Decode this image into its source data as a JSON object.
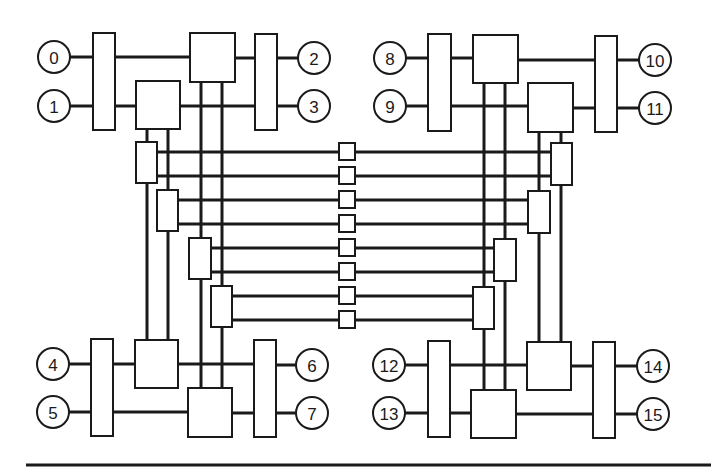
{
  "diagram": {
    "title": "",
    "colors": {
      "stroke": "#1a1a1a",
      "fill": "#ffffff",
      "background": "#ffffff"
    },
    "nodes": [
      {
        "id": "n0",
        "label": "0",
        "x": 54,
        "y": 57
      },
      {
        "id": "n1",
        "label": "1",
        "x": 54,
        "y": 106
      },
      {
        "id": "n2",
        "label": "2",
        "x": 314,
        "y": 58
      },
      {
        "id": "n3",
        "label": "3",
        "x": 314,
        "y": 106
      },
      {
        "id": "n4",
        "label": "4",
        "x": 53,
        "y": 364
      },
      {
        "id": "n5",
        "label": "5",
        "x": 53,
        "y": 412
      },
      {
        "id": "n6",
        "label": "6",
        "x": 312,
        "y": 365
      },
      {
        "id": "n7",
        "label": "7",
        "x": 312,
        "y": 413
      },
      {
        "id": "n8",
        "label": "8",
        "x": 390,
        "y": 58
      },
      {
        "id": "n9",
        "label": "9",
        "x": 390,
        "y": 106
      },
      {
        "id": "n10",
        "label": "10",
        "x": 655,
        "y": 60
      },
      {
        "id": "n11",
        "label": "11",
        "x": 655,
        "y": 108
      },
      {
        "id": "n12",
        "label": "12",
        "x": 389,
        "y": 365
      },
      {
        "id": "n13",
        "label": "13",
        "x": 389,
        "y": 413
      },
      {
        "id": "n14",
        "label": "14",
        "x": 653,
        "y": 366
      },
      {
        "id": "n15",
        "label": "15",
        "x": 653,
        "y": 414
      }
    ],
    "node_radius": 16,
    "boxes": [
      {
        "id": "tl-bar-left",
        "x": 93,
        "y": 33,
        "w": 22,
        "h": 97
      },
      {
        "id": "tl-switch-a",
        "x": 190,
        "y": 33,
        "w": 45,
        "h": 49
      },
      {
        "id": "tl-switch-b",
        "x": 136,
        "y": 81,
        "w": 44,
        "h": 48
      },
      {
        "id": "tl-bar-right",
        "x": 255,
        "y": 34,
        "w": 22,
        "h": 96
      },
      {
        "id": "tr-bar-left",
        "x": 428,
        "y": 34,
        "w": 23,
        "h": 97
      },
      {
        "id": "tr-switch-c",
        "x": 473,
        "y": 35,
        "w": 45,
        "h": 48
      },
      {
        "id": "tr-switch-d",
        "x": 528,
        "y": 83,
        "w": 45,
        "h": 49
      },
      {
        "id": "tr-bar-right",
        "x": 595,
        "y": 36,
        "w": 22,
        "h": 96
      },
      {
        "id": "bl-bar-left",
        "x": 91,
        "y": 339,
        "w": 22,
        "h": 97
      },
      {
        "id": "bl-switch-e",
        "x": 135,
        "y": 340,
        "w": 43,
        "h": 48
      },
      {
        "id": "bl-switch-f",
        "x": 188,
        "y": 388,
        "w": 44,
        "h": 49
      },
      {
        "id": "bl-bar-right",
        "x": 254,
        "y": 340,
        "w": 22,
        "h": 97
      },
      {
        "id": "br-bar-left",
        "x": 428,
        "y": 341,
        "w": 22,
        "h": 96
      },
      {
        "id": "br-switch-g",
        "x": 527,
        "y": 342,
        "w": 44,
        "h": 48
      },
      {
        "id": "br-switch-h",
        "x": 471,
        "y": 390,
        "w": 45,
        "h": 48
      },
      {
        "id": "br-bar-right",
        "x": 593,
        "y": 342,
        "w": 22,
        "h": 96
      },
      {
        "id": "ml-stage-1",
        "x": 136,
        "y": 142,
        "w": 21,
        "h": 41
      },
      {
        "id": "ml-stage-2",
        "x": 157,
        "y": 190,
        "w": 21,
        "h": 41
      },
      {
        "id": "ml-stage-3",
        "x": 189,
        "y": 238,
        "w": 22,
        "h": 41
      },
      {
        "id": "ml-stage-4",
        "x": 211,
        "y": 286,
        "w": 21,
        "h": 41
      },
      {
        "id": "mr-stage-1",
        "x": 551,
        "y": 143,
        "w": 21,
        "h": 42
      },
      {
        "id": "mr-stage-2",
        "x": 528,
        "y": 191,
        "w": 22,
        "h": 42
      },
      {
        "id": "mr-stage-3",
        "x": 494,
        "y": 239,
        "w": 22,
        "h": 42
      },
      {
        "id": "mr-stage-4",
        "x": 473,
        "y": 287,
        "w": 21,
        "h": 42
      },
      {
        "id": "mid-link-1",
        "x": 339,
        "y": 143,
        "w": 16,
        "h": 17
      },
      {
        "id": "mid-link-2",
        "x": 339,
        "y": 167,
        "w": 16,
        "h": 17
      },
      {
        "id": "mid-link-3",
        "x": 339,
        "y": 191,
        "w": 16,
        "h": 17
      },
      {
        "id": "mid-link-4",
        "x": 339,
        "y": 215,
        "w": 16,
        "h": 17
      },
      {
        "id": "mid-link-5",
        "x": 339,
        "y": 239,
        "w": 16,
        "h": 17
      },
      {
        "id": "mid-link-6",
        "x": 339,
        "y": 263,
        "w": 16,
        "h": 17
      },
      {
        "id": "mid-link-7",
        "x": 339,
        "y": 287,
        "w": 16,
        "h": 17
      },
      {
        "id": "mid-link-8",
        "x": 339,
        "y": 311,
        "w": 16,
        "h": 17
      }
    ],
    "wires": [
      [
        70,
        57,
        93,
        57
      ],
      [
        115,
        57,
        190,
        57
      ],
      [
        235,
        58,
        255,
        58
      ],
      [
        277,
        58,
        298,
        58
      ],
      [
        70,
        106,
        93,
        106
      ],
      [
        115,
        106,
        136,
        106
      ],
      [
        180,
        106,
        255,
        106
      ],
      [
        277,
        106,
        298,
        106
      ],
      [
        406,
        58,
        428,
        58
      ],
      [
        451,
        58,
        473,
        58
      ],
      [
        518,
        60,
        595,
        60
      ],
      [
        617,
        60,
        639,
        60
      ],
      [
        406,
        106,
        428,
        106
      ],
      [
        451,
        106,
        528,
        106
      ],
      [
        573,
        108,
        595,
        108
      ],
      [
        617,
        108,
        639,
        108
      ],
      [
        69,
        364,
        91,
        364
      ],
      [
        113,
        364,
        135,
        364
      ],
      [
        178,
        364,
        254,
        364
      ],
      [
        276,
        365,
        296,
        365
      ],
      [
        69,
        412,
        91,
        412
      ],
      [
        113,
        412,
        188,
        412
      ],
      [
        232,
        413,
        254,
        413
      ],
      [
        276,
        413,
        296,
        413
      ],
      [
        405,
        365,
        428,
        365
      ],
      [
        450,
        365,
        527,
        365
      ],
      [
        571,
        366,
        593,
        366
      ],
      [
        615,
        366,
        637,
        366
      ],
      [
        405,
        413,
        428,
        413
      ],
      [
        450,
        413,
        471,
        413
      ],
      [
        516,
        414,
        593,
        414
      ],
      [
        615,
        414,
        637,
        414
      ],
      [
        147,
        129,
        147,
        142
      ],
      [
        147,
        183,
        147,
        340
      ],
      [
        168,
        129,
        168,
        190
      ],
      [
        168,
        231,
        168,
        340
      ],
      [
        201,
        82,
        201,
        238
      ],
      [
        201,
        279,
        201,
        388
      ],
      [
        222,
        82,
        222,
        286
      ],
      [
        222,
        327,
        222,
        388
      ],
      [
        484,
        83,
        484,
        287
      ],
      [
        484,
        329,
        484,
        390
      ],
      [
        505,
        83,
        505,
        239
      ],
      [
        505,
        281,
        505,
        390
      ],
      [
        539,
        132,
        539,
        191
      ],
      [
        539,
        233,
        539,
        342
      ],
      [
        561,
        132,
        561,
        143
      ],
      [
        561,
        185,
        561,
        342
      ],
      [
        157,
        152,
        339,
        152
      ],
      [
        355,
        152,
        551,
        152
      ],
      [
        157,
        176,
        339,
        176
      ],
      [
        355,
        176,
        551,
        176
      ],
      [
        178,
        200,
        339,
        200
      ],
      [
        355,
        200,
        528,
        200
      ],
      [
        178,
        224,
        339,
        224
      ],
      [
        355,
        224,
        528,
        224
      ],
      [
        211,
        248,
        339,
        248
      ],
      [
        355,
        248,
        494,
        248
      ],
      [
        211,
        272,
        339,
        272
      ],
      [
        355,
        272,
        494,
        272
      ],
      [
        232,
        296,
        339,
        296
      ],
      [
        355,
        296,
        473,
        296
      ],
      [
        232,
        320,
        339,
        320
      ],
      [
        355,
        320,
        473,
        320
      ]
    ],
    "rule": {
      "x1": 26,
      "y1": 465,
      "x2": 711,
      "y2": 465
    }
  }
}
